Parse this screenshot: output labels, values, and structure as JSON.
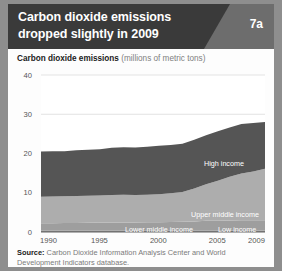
{
  "header": {
    "title": "Carbon dioxide emissions dropped slightly in 2009",
    "title_line1": "Carbon dioxide emissions",
    "title_line2": "dropped slightly in 2009",
    "badge": "7a",
    "bg_color": "#3a3a3a",
    "wedge_color": "#6d6d6d"
  },
  "subtitle": {
    "bold": "Carbon dioxide emissions",
    "rest": " (millions of metric tons)"
  },
  "source": {
    "label": "Source:",
    "text": " Carbon Dioxide Information Analysis Center and World Development Indicators database."
  },
  "chart_data": {
    "type": "area",
    "stacked": true,
    "title": "Carbon dioxide emissions dropped slightly in 2009",
    "subtitle": "Carbon dioxide emissions (millions of metric tons)",
    "xlabel": "",
    "ylabel": "millions of metric tons",
    "xlim": [
      1990,
      2009
    ],
    "ylim": [
      0,
      40
    ],
    "yticks": [
      0,
      10,
      20,
      30,
      40
    ],
    "ytick_labels": [
      "0",
      "10",
      "20",
      "30",
      "40"
    ],
    "xticks": [
      1990,
      1995,
      2000,
      2005,
      2009
    ],
    "xtick_labels": [
      "1990",
      "1995",
      "2000",
      "2005",
      "2009"
    ],
    "grid": "horizontal",
    "legend": "inline-labels",
    "x": [
      1990,
      1991,
      1992,
      1993,
      1994,
      1995,
      1996,
      1997,
      1998,
      1999,
      2000,
      2001,
      2002,
      2003,
      2004,
      2005,
      2006,
      2007,
      2008,
      2009
    ],
    "series": [
      {
        "name": "Low income",
        "color": "#8c8c8c",
        "values": [
          0.3,
          0.3,
          0.3,
          0.3,
          0.3,
          0.3,
          0.3,
          0.3,
          0.3,
          0.3,
          0.3,
          0.3,
          0.3,
          0.3,
          0.35,
          0.35,
          0.4,
          0.4,
          0.4,
          0.4
        ]
      },
      {
        "name": "Lower middle income",
        "color": "#9e9e9e",
        "values": [
          1.9,
          1.95,
          2.0,
          2.0,
          2.05,
          2.1,
          2.15,
          2.15,
          2.15,
          2.2,
          2.2,
          2.25,
          2.3,
          2.4,
          2.5,
          2.5,
          2.55,
          2.6,
          2.6,
          2.6
        ]
      },
      {
        "name": "Upper middle income",
        "color": "#adadad",
        "values": [
          6.8,
          6.8,
          6.8,
          6.9,
          6.9,
          6.9,
          7.0,
          7.05,
          7.0,
          7.0,
          7.1,
          7.3,
          7.6,
          8.4,
          9.3,
          10.2,
          11.1,
          11.9,
          12.4,
          13.1
        ]
      },
      {
        "name": "High income",
        "color": "#555555",
        "values": [
          11.5,
          11.5,
          11.5,
          11.6,
          11.7,
          11.8,
          12.0,
          12.1,
          12.1,
          12.2,
          12.4,
          12.3,
          12.3,
          12.4,
          12.5,
          12.6,
          12.6,
          12.6,
          12.4,
          11.9
        ]
      }
    ],
    "totals": [
      20.5,
      20.55,
      20.6,
      20.8,
      20.95,
      21.1,
      21.45,
      21.6,
      21.55,
      21.7,
      22.0,
      22.15,
      22.5,
      23.5,
      24.65,
      25.65,
      26.65,
      27.5,
      27.8,
      28.0
    ],
    "series_label_positions": [
      {
        "name": "High income",
        "x": 196,
        "y": 155
      },
      {
        "name": "Upper middle income",
        "x": 183,
        "y": 206
      },
      {
        "name": "Lower middle income",
        "x": 117,
        "y": 221
      },
      {
        "name": "Low income",
        "x": 210,
        "y": 221
      }
    ]
  }
}
